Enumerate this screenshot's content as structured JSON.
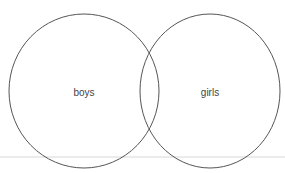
{
  "diagram": {
    "type": "venn",
    "sets": [
      {
        "label": "boys"
      },
      {
        "label": "girls"
      }
    ],
    "colors": {
      "circle_stroke": "#555555",
      "baseline": "#d8d8d8",
      "text": "#444444"
    }
  }
}
